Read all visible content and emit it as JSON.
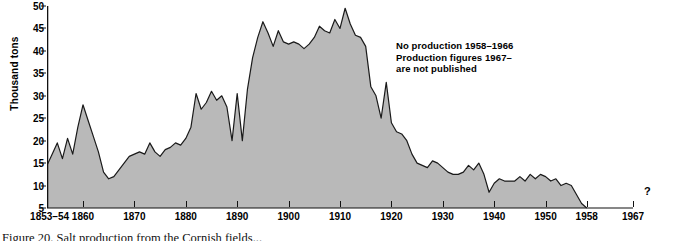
{
  "chart_data": {
    "type": "area",
    "title": "",
    "xlabel": "",
    "ylabel": "Thousand tons",
    "ylim": [
      5,
      50
    ],
    "xlim": [
      1853,
      1967
    ],
    "grid": false,
    "legend_position": "none",
    "fill_color": "#b9b9b9",
    "line_color": "#1a1a1a",
    "yticks": [
      5,
      10,
      15,
      20,
      25,
      30,
      35,
      40,
      45,
      50
    ],
    "xticks": [
      {
        "label": "1853–54",
        "year": 1853.5
      },
      {
        "label": "1860",
        "year": 1860
      },
      {
        "label": "1870",
        "year": 1870
      },
      {
        "label": "1880",
        "year": 1880
      },
      {
        "label": "1890",
        "year": 1890
      },
      {
        "label": "1900",
        "year": 1900
      },
      {
        "label": "1910",
        "year": 1910
      },
      {
        "label": "1920",
        "year": 1920
      },
      {
        "label": "1930",
        "year": 1930
      },
      {
        "label": "1940",
        "year": 1940
      },
      {
        "label": "1950",
        "year": 1950
      },
      {
        "label": "1958",
        "year": 1958
      },
      {
        "label": "1967",
        "year": 1967
      }
    ],
    "annotation": {
      "line1": "No production 1958–1966",
      "line2": "Production figures 1967–",
      "line3": "are not published"
    },
    "uncertainty_marker": "?",
    "x": [
      1853,
      1854,
      1855,
      1856,
      1857,
      1858,
      1859,
      1860,
      1861,
      1862,
      1863,
      1864,
      1865,
      1866,
      1867,
      1868,
      1869,
      1870,
      1871,
      1872,
      1873,
      1874,
      1875,
      1876,
      1877,
      1878,
      1879,
      1880,
      1881,
      1882,
      1883,
      1884,
      1885,
      1886,
      1887,
      1888,
      1889,
      1890,
      1891,
      1892,
      1893,
      1894,
      1895,
      1896,
      1897,
      1898,
      1899,
      1900,
      1901,
      1902,
      1903,
      1904,
      1905,
      1906,
      1907,
      1908,
      1909,
      1910,
      1911,
      1912,
      1913,
      1914,
      1915,
      1916,
      1917,
      1918,
      1919,
      1920,
      1921,
      1922,
      1923,
      1924,
      1925,
      1926,
      1927,
      1928,
      1929,
      1930,
      1931,
      1932,
      1933,
      1934,
      1935,
      1936,
      1937,
      1938,
      1939,
      1940,
      1941,
      1942,
      1943,
      1944,
      1945,
      1946,
      1947,
      1948,
      1949,
      1950,
      1951,
      1952,
      1953,
      1954,
      1955,
      1956,
      1957,
      1958
    ],
    "values": [
      14.5,
      17.0,
      19.5,
      16.0,
      20.5,
      17.0,
      23.0,
      28.0,
      24.5,
      21.0,
      17.5,
      13.0,
      11.5,
      12.0,
      13.5,
      15.0,
      16.5,
      17.0,
      17.5,
      17.0,
      19.5,
      17.5,
      16.5,
      18.0,
      18.5,
      19.5,
      19.0,
      20.5,
      23.0,
      30.5,
      27.0,
      28.5,
      31.0,
      29.0,
      30.0,
      27.5,
      20.0,
      30.5,
      20.0,
      31.5,
      38.5,
      43.0,
      46.5,
      44.0,
      41.0,
      44.5,
      42.0,
      41.5,
      42.0,
      41.5,
      40.5,
      41.5,
      43.0,
      45.5,
      44.5,
      44.0,
      47.0,
      45.0,
      49.5,
      46.0,
      43.5,
      43.0,
      41.0,
      32.0,
      30.0,
      25.0,
      33.0,
      24.0,
      22.0,
      21.5,
      20.0,
      17.0,
      15.0,
      14.5,
      14.0,
      15.5,
      15.0,
      14.0,
      13.0,
      12.5,
      12.5,
      13.0,
      14.5,
      13.5,
      15.0,
      12.5,
      8.5,
      10.5,
      11.5,
      11.0,
      11.0,
      11.0,
      12.0,
      11.0,
      12.5,
      11.5,
      12.5,
      12.0,
      11.0,
      11.5,
      10.0,
      10.5,
      10.0,
      8.0,
      6.0,
      5.0
    ],
    "caption": "Figure 20.  Salt production from the Cornish fields..."
  }
}
